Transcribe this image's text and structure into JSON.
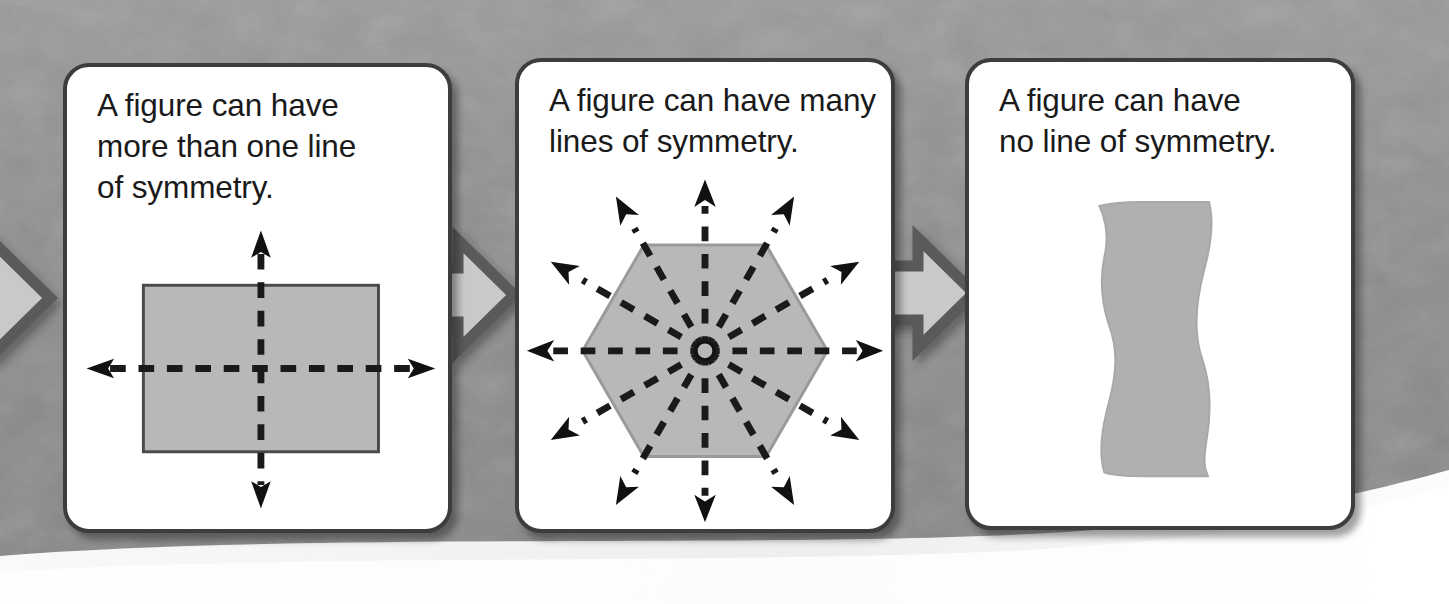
{
  "page": {
    "background_color": "#8f8f8f",
    "panel_background": "#ffffff",
    "panel_border_color": "#3d3d3d",
    "figure_fill": "#b8b8b8",
    "figure_stroke": "#4a4a4a",
    "arrow_fill": "#c9c9c9",
    "arrow_stroke": "#5a5a5a",
    "symmetry_line_color": "#1a1a1a"
  },
  "panels": [
    {
      "id": "panel-1",
      "text": "A figure can have\nmore than one line\nof symmetry.",
      "figure": {
        "name": "rectangle",
        "lines_of_symmetry": 2,
        "line_directions_deg": [
          90,
          0
        ]
      }
    },
    {
      "id": "panel-2",
      "text": "A figure can have many\nlines of symmetry.",
      "figure": {
        "name": "regular-hexagon",
        "lines_of_symmetry": 6,
        "line_directions_deg": [
          0,
          30,
          60,
          90,
          120,
          150
        ]
      }
    },
    {
      "id": "panel-3",
      "text": "A figure can have\nno line of symmetry.",
      "figure": {
        "name": "wavy-irregular-shape",
        "lines_of_symmetry": 0,
        "line_directions_deg": []
      }
    }
  ],
  "connectors": [
    {
      "id": "arrow-0",
      "icon": "block-arrow-right-icon",
      "direction": "right"
    },
    {
      "id": "arrow-1",
      "icon": "block-arrow-right-icon",
      "direction": "right"
    },
    {
      "id": "arrow-2",
      "icon": "block-arrow-right-icon",
      "direction": "right"
    }
  ]
}
